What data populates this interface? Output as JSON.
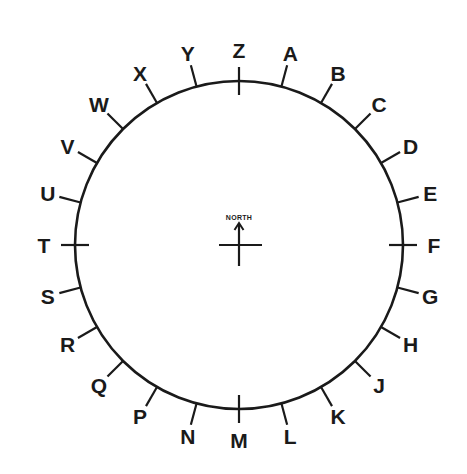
{
  "diagram": {
    "type": "compass-dial",
    "center": {
      "x": 239,
      "y": 245
    },
    "radius": 164,
    "stroke_color": "#1a1a1a",
    "center_label": "NORTH",
    "labels": [
      "Z",
      "A",
      "B",
      "C",
      "D",
      "E",
      "F",
      "G",
      "H",
      "J",
      "K",
      "L",
      "M",
      "N",
      "P",
      "Q",
      "R",
      "S",
      "T",
      "U",
      "V",
      "W",
      "X",
      "Y"
    ],
    "major_labels": [
      "Z",
      "F",
      "M",
      "T"
    ]
  }
}
